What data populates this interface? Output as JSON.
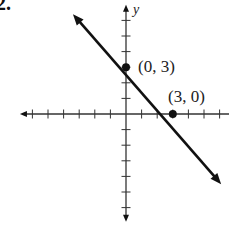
{
  "problem_number": "2.",
  "chart_data": {
    "type": "line",
    "title": "",
    "xlabel": "",
    "ylabel": "y",
    "equation": "y = -x + 3",
    "series": [
      {
        "name": "line",
        "x": [
          -3.4,
          6.1
        ],
        "y": [
          6.4,
          -4.5
        ],
        "color": "#111111",
        "arrows_both_ends": true
      }
    ],
    "points": [
      {
        "label": "(0, 3)",
        "x": 0,
        "y": 3
      },
      {
        "label": "(3, 0)",
        "x": 3,
        "y": 0
      }
    ],
    "xlim": [
      -6.8,
      6.5
    ],
    "ylim": [
      -6.9,
      7
    ],
    "x_ticks": [
      -6,
      -5,
      -4,
      -3,
      -2,
      -1,
      1,
      2,
      3,
      4,
      5,
      6
    ],
    "y_ticks": [
      -6,
      -5,
      -4,
      -3,
      -2,
      -1,
      1,
      2,
      3,
      4,
      5,
      6
    ],
    "grid": false,
    "legend": null
  },
  "labels": {
    "y_axis": "y",
    "point_a": "(0, 3)",
    "point_b": "(3, 0)"
  },
  "colors": {
    "ink": "#111111",
    "axis": "#333333"
  }
}
